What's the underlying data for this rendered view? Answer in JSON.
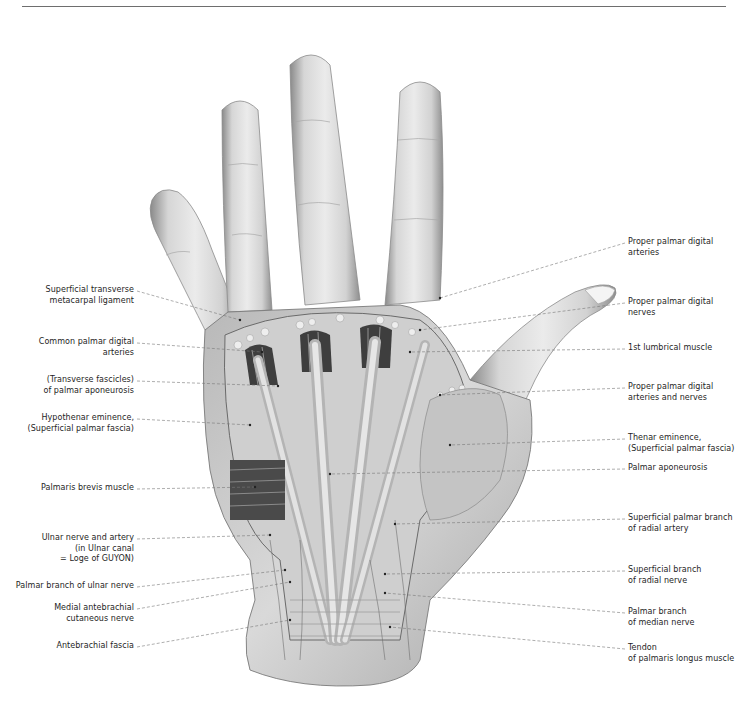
{
  "figure": {
    "colors": {
      "line": "#777777",
      "skin_light": "#e6e6e6",
      "skin_mid": "#bdbdbd",
      "skin_dark": "#7a7a7a",
      "text": "#1e1e1e"
    }
  },
  "labels_left": [
    {
      "id": "superficial-transverse-metacarpal-ligament",
      "lines": [
        "Superficial transverse",
        "metacarpal ligament"
      ],
      "x_right": 134,
      "y": 290,
      "tx": 240,
      "ty": 320
    },
    {
      "id": "common-palmar-digital-arteries",
      "lines": [
        "Common palmar digital",
        "arteries"
      ],
      "x_right": 134,
      "y": 342,
      "tx": 262,
      "ty": 352
    },
    {
      "id": "transverse-fascicles-palmar-aponeurosis",
      "lines": [
        "(Transverse fascicles)",
        "of palmar aponeurosis"
      ],
      "x_right": 134,
      "y": 380,
      "tx": 278,
      "ty": 386
    },
    {
      "id": "hypothenar-eminence",
      "lines": [
        "Hypothenar eminence,",
        "(Superficial palmar fascia)"
      ],
      "x_right": 134,
      "y": 418,
      "tx": 250,
      "ty": 425
    },
    {
      "id": "palmaris-brevis-muscle",
      "lines": [
        "Palmaris brevis muscle"
      ],
      "x_right": 134,
      "y": 488,
      "tx": 255,
      "ty": 487
    },
    {
      "id": "ulnar-nerve-and-artery",
      "lines": [
        "Ulnar nerve and artery",
        "(in Ulnar canal",
        "= Loge of GUYON)"
      ],
      "x_right": 134,
      "y": 538,
      "tx": 270,
      "ty": 535
    },
    {
      "id": "palmar-branch-ulnar-nerve",
      "lines": [
        "Palmar branch of ulnar nerve"
      ],
      "x_right": 134,
      "y": 586,
      "tx": 285,
      "ty": 570
    },
    {
      "id": "medial-antebrachial-cutaneous-nerve",
      "lines": [
        "Medial antebrachial",
        "cutaneous nerve"
      ],
      "x_right": 134,
      "y": 608,
      "tx": 290,
      "ty": 582
    },
    {
      "id": "antebrachial-fascia",
      "lines": [
        "Antebrachial fascia"
      ],
      "x_right": 134,
      "y": 646,
      "tx": 290,
      "ty": 620
    }
  ],
  "labels_right": [
    {
      "id": "proper-palmar-digital-arteries",
      "lines": [
        "Proper palmar digital",
        "arteries"
      ],
      "x_left": 628,
      "y": 242,
      "tx": 440,
      "ty": 298
    },
    {
      "id": "proper-palmar-digital-nerves",
      "lines": [
        "Proper palmar digital",
        "nerves"
      ],
      "x_left": 628,
      "y": 302,
      "tx": 420,
      "ty": 330
    },
    {
      "id": "1st-lumbrical-muscle",
      "lines": [
        "1st lumbrical muscle"
      ],
      "x_left": 628,
      "y": 348,
      "tx": 410,
      "ty": 352
    },
    {
      "id": "proper-palmar-digital-arteries-and-nerves",
      "lines": [
        "Proper palmar digital",
        "arteries and nerves"
      ],
      "x_left": 628,
      "y": 387,
      "tx": 440,
      "ty": 395
    },
    {
      "id": "thenar-eminence",
      "lines": [
        "Thenar eminence,",
        "(Superficial palmar fascia)"
      ],
      "x_left": 628,
      "y": 438,
      "tx": 450,
      "ty": 445
    },
    {
      "id": "palmar-aponeurosis",
      "lines": [
        "Palmar aponeurosis"
      ],
      "x_left": 628,
      "y": 468,
      "tx": 330,
      "ty": 474
    },
    {
      "id": "superficial-palmar-branch-radial-artery",
      "lines": [
        "Superficial palmar branch",
        "of radial artery"
      ],
      "x_left": 628,
      "y": 518,
      "tx": 395,
      "ty": 524
    },
    {
      "id": "superficial-branch-radial-nerve",
      "lines": [
        "Superficial branch",
        "of radial nerve"
      ],
      "x_left": 628,
      "y": 570,
      "tx": 385,
      "ty": 574
    },
    {
      "id": "palmar-branch-median-nerve",
      "lines": [
        "Palmar branch",
        "of median nerve"
      ],
      "x_left": 628,
      "y": 612,
      "tx": 385,
      "ty": 593
    },
    {
      "id": "tendon-palmaris-longus",
      "lines": [
        "Tendon",
        "of palmaris longus muscle"
      ],
      "x_left": 628,
      "y": 648,
      "tx": 390,
      "ty": 627
    }
  ]
}
